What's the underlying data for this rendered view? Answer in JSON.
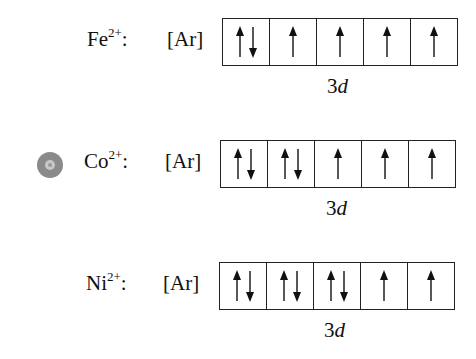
{
  "diagram": {
    "rows": [
      {
        "ion": "Fe",
        "charge": "2+",
        "colon": ":",
        "core": "[Ar]",
        "subshell_num": "3",
        "subshell_letter": "d",
        "orbitals": [
          "up-down",
          "up",
          "up",
          "up",
          "up"
        ]
      },
      {
        "ion": "Co",
        "charge": "2+",
        "colon": ":",
        "core": "[Ar]",
        "subshell_num": "3",
        "subshell_letter": "d",
        "orbitals": [
          "up-down",
          "up-down",
          "up",
          "up",
          "up"
        ]
      },
      {
        "ion": "Ni",
        "charge": "2+",
        "colon": ":",
        "core": "[Ar]",
        "subshell_num": "3",
        "subshell_letter": "d",
        "orbitals": [
          "up-down",
          "up-down",
          "up-down",
          "up",
          "up"
        ]
      }
    ],
    "marker": {
      "icon": "target-circle-icon",
      "row": 1,
      "color": "#8a8a8a"
    }
  }
}
